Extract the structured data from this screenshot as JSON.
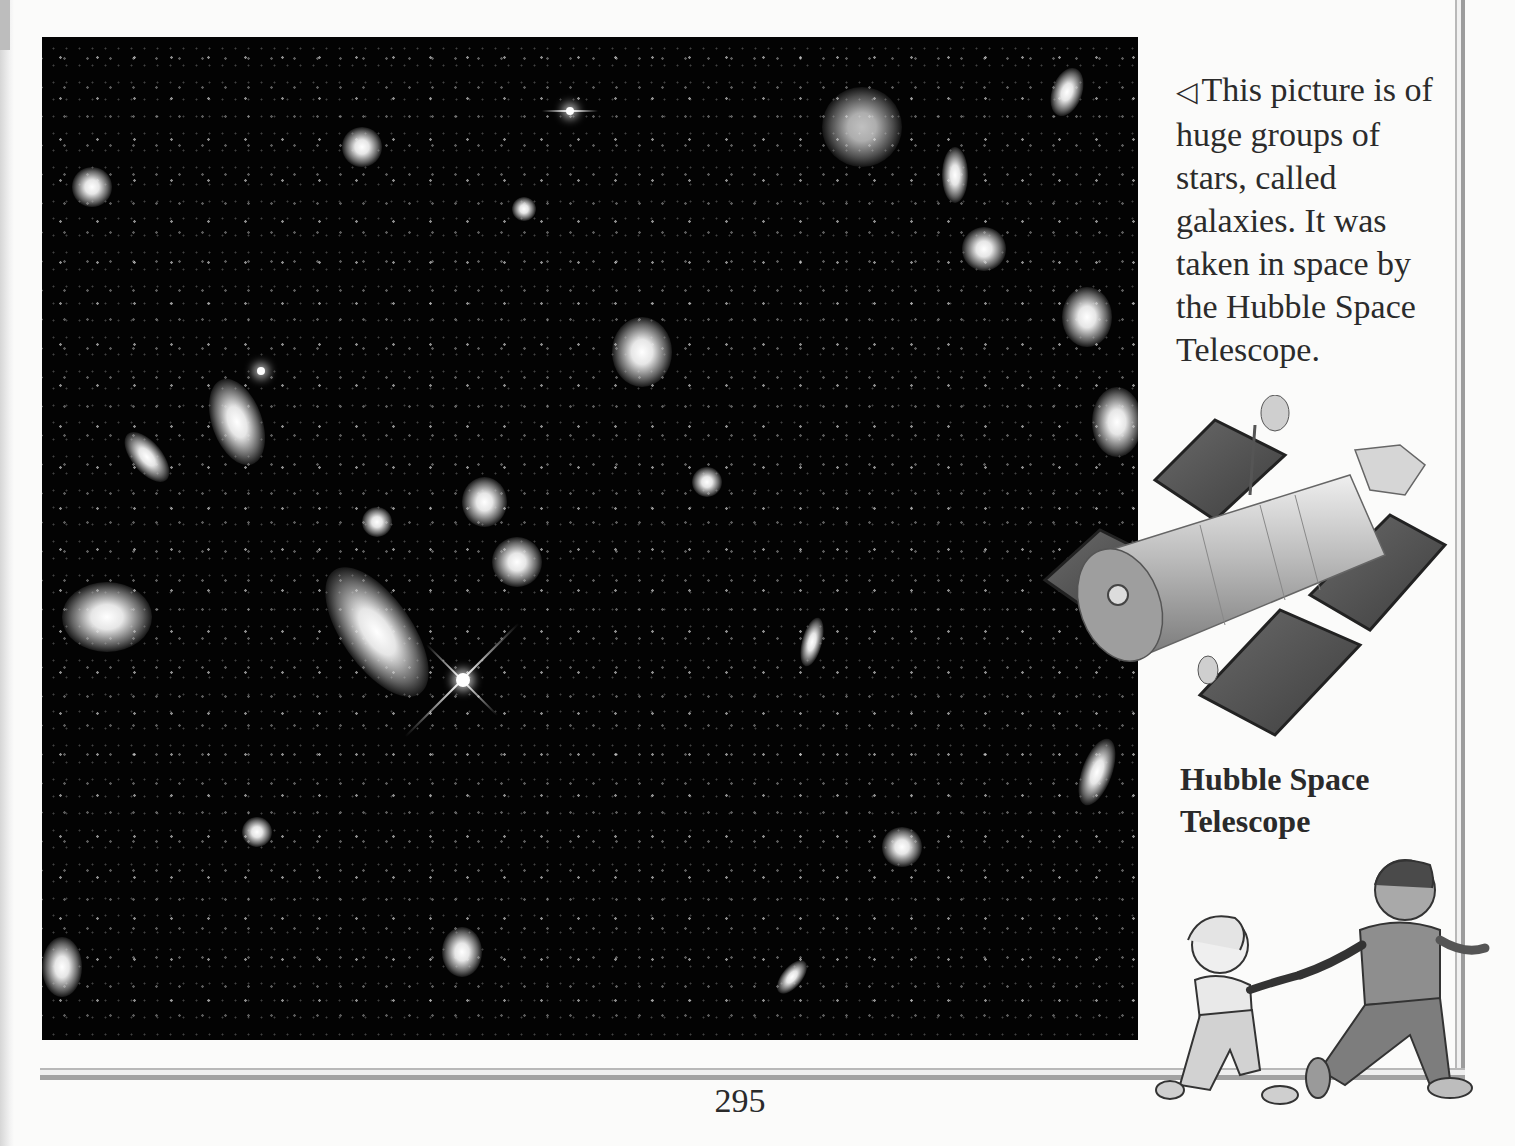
{
  "page": {
    "number": "295"
  },
  "photo": {
    "subject": "galaxies-deep-field",
    "alt": "Hubble deep field photograph of many galaxies"
  },
  "caption": {
    "arrow_icon": "◁",
    "text": "This picture is of huge groups of stars, called galaxies. It was taken in space by the Hubble Space Telescope."
  },
  "illustration": {
    "telescope_label": "Hubble Space Telescope",
    "kids": "two children running hand in hand"
  },
  "colors": {
    "paper": "#fbfbfa",
    "photo_bg": "#030303",
    "frame": "#a2a2a2",
    "text": "#2a2a2a"
  }
}
